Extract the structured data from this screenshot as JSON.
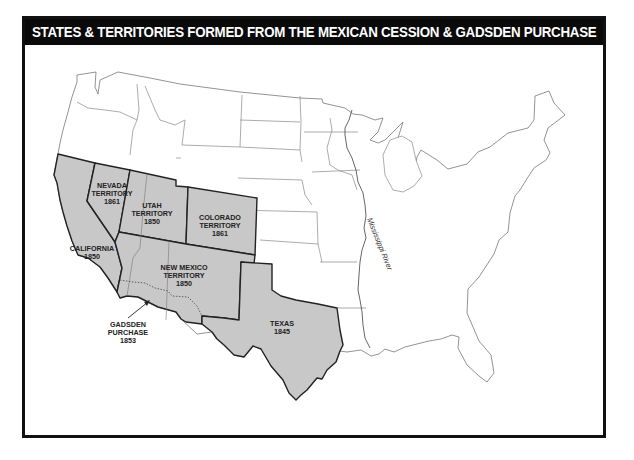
{
  "title": "STATES & TERRITORIES FORMED FROM THE MEXICAN CESSION & GADSDEN PURCHASE",
  "colors": {
    "header_bg": "#0a0a0a",
    "header_text": "#ffffff",
    "ceded_fill": "#c8c8c8",
    "state_line": "#777777",
    "ceded_border": "#222222",
    "frame": "#111111"
  },
  "regions": [
    {
      "name": "NEVADA",
      "type": "TERRITORY",
      "year": "1861"
    },
    {
      "name": "UTAH",
      "type": "TERRITORY",
      "year": "1850"
    },
    {
      "name": "COLORADO",
      "type": "TERRITORY",
      "year": "1861"
    },
    {
      "name": "CALIFORNIA",
      "type": "",
      "year": "1850"
    },
    {
      "name": "NEW MEXICO",
      "type": "TERRITORY",
      "year": "1850"
    },
    {
      "name": "TEXAS",
      "type": "",
      "year": "1845"
    }
  ],
  "labels": {
    "nevada": {
      "line1": "NEVADA",
      "line2": "TERRITORY",
      "line3": "1861"
    },
    "utah": {
      "line1": "UTAH",
      "line2": "TERRITORY",
      "line3": "1850"
    },
    "colorado": {
      "line1": "COLORADO",
      "line2": "TERRITORY",
      "line3": "1861"
    },
    "california": {
      "line1": "CALIFORNIA",
      "line2": "1850"
    },
    "new_mexico": {
      "line1": "NEW MEXICO",
      "line2": "TERRITORY",
      "line3": "1850"
    },
    "texas": {
      "line1": "TEXAS",
      "line2": "1845"
    },
    "gadsden": {
      "line1": "GADSDEN",
      "line2": "PURCHASE",
      "line3": "1853"
    },
    "river": "Mississippi River"
  }
}
